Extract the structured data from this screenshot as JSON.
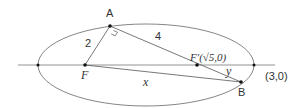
{
  "diagram": {
    "type": "ellipse-geometry",
    "ellipse": {
      "center": [
        0,
        0
      ],
      "a": 3,
      "b": 2
    },
    "points": {
      "A": {
        "label": "A"
      },
      "B": {
        "label": "B"
      },
      "F": {
        "label": "F"
      },
      "F_prime": {
        "label": "F′(√5,0)"
      },
      "right_vertex": {
        "label": "(3,0)"
      }
    },
    "segments": {
      "AF": {
        "label": "2"
      },
      "AF_prime": {
        "label": "4"
      },
      "FB": {
        "label": "x"
      },
      "F_prime_B": {
        "label": "y"
      }
    },
    "annotations": {
      "right_angle_at": "A"
    },
    "colors": {
      "stroke": "#555555",
      "text": "#333333",
      "point": "#111111"
    }
  }
}
